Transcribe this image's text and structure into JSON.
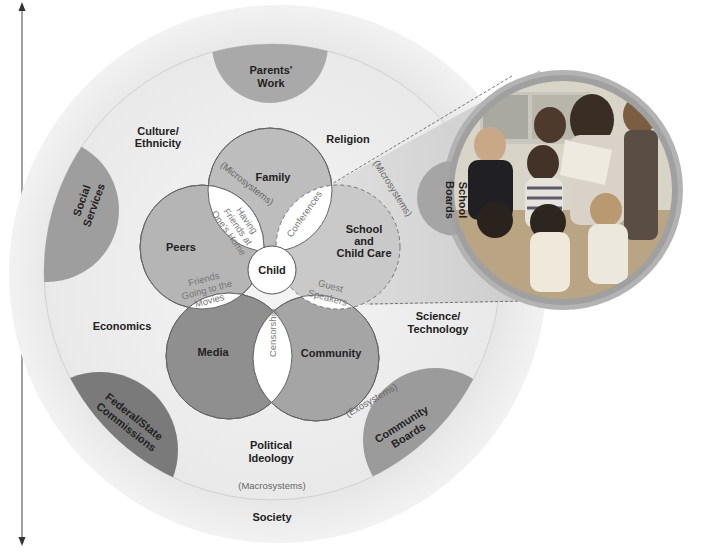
{
  "diagram": {
    "axis": {
      "label": "Chronosystem"
    },
    "levels": {
      "society": "Society",
      "macrosystems": "(Macrosystems)",
      "exosystems": "(Exosystems)",
      "microsystems_inner": "(Microsystems)",
      "microsystems_school": "(Microsystems)"
    },
    "center": {
      "label": "Child"
    },
    "microsystems": [
      {
        "id": "family",
        "label": "Family"
      },
      {
        "id": "peers",
        "label": "Peers"
      },
      {
        "id": "media",
        "label": "Media"
      },
      {
        "id": "community",
        "label": "Community"
      },
      {
        "id": "school",
        "label_lines": [
          "School",
          "and",
          "Child Care"
        ]
      }
    ],
    "mesosystems": [
      {
        "id": "family-peers",
        "label_lines": [
          "Having",
          "Friends at",
          "One's Home"
        ]
      },
      {
        "id": "family-school",
        "label": "Conferences"
      },
      {
        "id": "peers-media",
        "label_lines": [
          "Friends",
          "Going to the",
          "Movies"
        ]
      },
      {
        "id": "media-community",
        "label": "Censorship"
      },
      {
        "id": "school-community",
        "label_lines": [
          "Guest",
          "Speakers"
        ]
      }
    ],
    "macro_labels": [
      {
        "id": "culture",
        "label_lines": [
          "Culture/",
          "Ethnicity"
        ]
      },
      {
        "id": "religion",
        "label": "Religion"
      },
      {
        "id": "economics",
        "label": "Economics"
      },
      {
        "id": "science",
        "label_lines": [
          "Science/",
          "Technology"
        ]
      },
      {
        "id": "political",
        "label_lines": [
          "Political",
          "Ideology"
        ]
      }
    ],
    "exosystems": [
      {
        "id": "parents-work",
        "label_lines": [
          "Parents'",
          "Work"
        ]
      },
      {
        "id": "social-services",
        "label_lines": [
          "Social",
          "Services"
        ]
      },
      {
        "id": "school-boards",
        "label_lines": [
          "School",
          "Boards"
        ]
      },
      {
        "id": "federal-state",
        "label_lines": [
          "Federal/State",
          "Commissions"
        ]
      },
      {
        "id": "community-boards",
        "label_lines": [
          "Community",
          "Boards"
        ]
      }
    ],
    "photo": {
      "alt": "Teacher reading a book to a group of young children in a classroom"
    },
    "colors": {
      "outer_ring": "#e6e6e6",
      "macro_ring": "#eeeeee",
      "exo_medium": "#a8a8a8",
      "exo_dark": "#7d7d7d",
      "micro_light": "#bdbdbd",
      "micro_dark": "#8f8f8f",
      "meso_white": "#ffffff"
    }
  }
}
